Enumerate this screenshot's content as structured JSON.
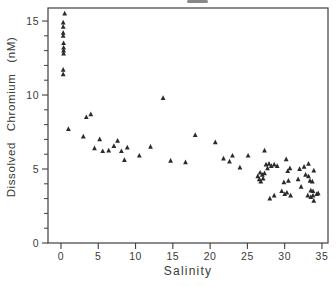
{
  "figure": {
    "background": "#ffffff",
    "axis_color": "#3f3f3f",
    "text_color": "#3a3a3a",
    "marker_color": "#2b2b2b",
    "artifact_note": "small cropped dark mark above top border, center"
  },
  "chart_data": {
    "type": "scatter",
    "title": "",
    "xlabel": "Salinity",
    "ylabel": "Dissolved  Chromium  (nM)",
    "marker": "filled-triangle-up",
    "grid": false,
    "legend": null,
    "xlim": [
      -1.74,
      35.81
    ],
    "ylim": [
      0,
      15.88
    ],
    "x_major_ticks": [
      0,
      5,
      10,
      15,
      20,
      25,
      30,
      35
    ],
    "y_major_ticks": [
      0,
      5,
      10,
      15
    ],
    "y_minor_tick_step": 1,
    "points": [
      [
        0.5,
        15.5
      ],
      [
        0.3,
        14.9
      ],
      [
        0.3,
        14.6
      ],
      [
        0.3,
        14.2
      ],
      [
        0.3,
        14.0
      ],
      [
        0.35,
        13.5
      ],
      [
        0.35,
        13.2
      ],
      [
        0.35,
        13.0
      ],
      [
        0.35,
        12.8
      ],
      [
        0.3,
        11.7
      ],
      [
        0.3,
        11.4
      ],
      [
        1.0,
        7.7
      ],
      [
        3.0,
        7.2
      ],
      [
        3.4,
        8.5
      ],
      [
        4.0,
        8.7
      ],
      [
        4.5,
        6.4
      ],
      [
        5.2,
        7.0
      ],
      [
        5.6,
        6.2
      ],
      [
        6.4,
        6.25
      ],
      [
        7.1,
        6.55
      ],
      [
        7.6,
        6.9
      ],
      [
        8.1,
        6.2
      ],
      [
        8.5,
        5.6
      ],
      [
        8.9,
        6.45
      ],
      [
        10.5,
        5.9
      ],
      [
        12.0,
        6.5
      ],
      [
        13.7,
        9.8
      ],
      [
        14.7,
        5.55
      ],
      [
        16.7,
        5.45
      ],
      [
        18.0,
        7.3
      ],
      [
        20.7,
        6.8
      ],
      [
        21.8,
        5.7
      ],
      [
        22.6,
        5.5
      ],
      [
        23.0,
        5.9
      ],
      [
        24.0,
        5.1
      ],
      [
        25.1,
        5.9
      ],
      [
        26.4,
        4.5
      ],
      [
        26.6,
        4.3
      ],
      [
        26.7,
        4.75
      ],
      [
        26.8,
        4.15
      ],
      [
        27.0,
        4.6
      ],
      [
        27.1,
        4.35
      ],
      [
        27.3,
        6.25
      ],
      [
        27.3,
        4.7
      ],
      [
        27.5,
        5.3
      ],
      [
        27.7,
        5.05
      ],
      [
        27.9,
        5.35
      ],
      [
        28.2,
        5.2
      ],
      [
        28.6,
        5.3
      ],
      [
        28.0,
        3.0
      ],
      [
        28.6,
        3.2
      ],
      [
        29.0,
        5.2
      ],
      [
        29.6,
        3.5
      ],
      [
        29.9,
        4.1
      ],
      [
        30.0,
        3.3
      ],
      [
        30.2,
        5.65
      ],
      [
        30.3,
        3.4
      ],
      [
        30.4,
        4.85
      ],
      [
        30.5,
        4.2
      ],
      [
        30.7,
        5.05
      ],
      [
        30.8,
        3.2
      ],
      [
        31.8,
        4.3
      ],
      [
        32.0,
        5.0
      ],
      [
        32.2,
        3.8
      ],
      [
        32.6,
        5.15
      ],
      [
        32.8,
        4.6
      ],
      [
        33.2,
        5.35
      ],
      [
        33.2,
        4.5
      ],
      [
        33.4,
        4.2
      ],
      [
        33.5,
        3.55
      ],
      [
        33.7,
        4.15
      ],
      [
        33.8,
        3.5
      ],
      [
        33.9,
        4.9
      ],
      [
        33.1,
        3.2
      ],
      [
        33.5,
        3.1
      ],
      [
        33.8,
        3.2
      ],
      [
        33.9,
        2.85
      ],
      [
        34.3,
        3.3
      ],
      [
        34.5,
        3.35
      ]
    ]
  }
}
